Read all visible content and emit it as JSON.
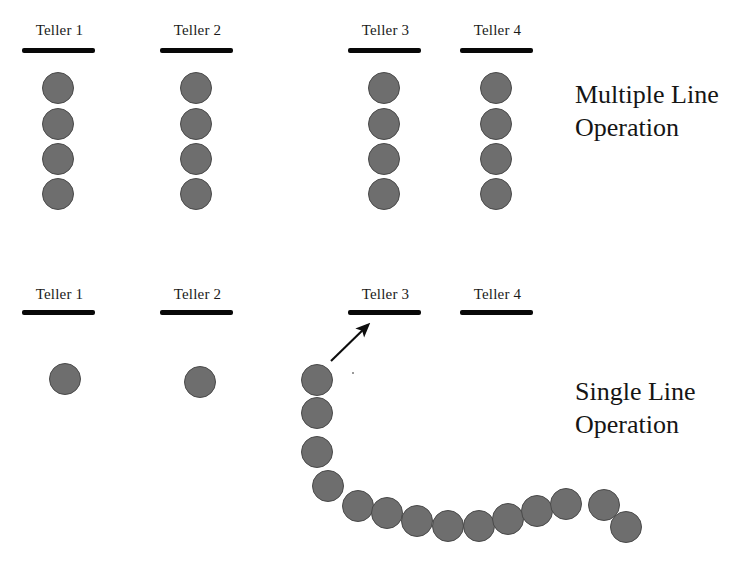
{
  "canvas": {
    "width": 742,
    "height": 565,
    "background": "#ffffff"
  },
  "style": {
    "person_fill": "#6e6e6e",
    "person_stroke": "#4a4a4a",
    "bar_color": "#080808",
    "text_color": "#151515",
    "person_diameter": 32
  },
  "sections": [
    {
      "id": "multiple-line",
      "caption_lines": [
        "Multiple Line",
        "Operation"
      ],
      "caption_x": 575,
      "caption_y": 78,
      "tellers": [
        {
          "label": "Teller 1",
          "label_x": 23,
          "label_y": 22,
          "bar": {
            "x": 22,
            "y": 48,
            "width": 73,
            "height": 5
          },
          "queue": [
            {
              "cx": 58,
              "cy": 88
            },
            {
              "cx": 58,
              "cy": 124
            },
            {
              "cx": 58,
              "cy": 159
            },
            {
              "cx": 58,
              "cy": 194
            }
          ]
        },
        {
          "label": "Teller 2",
          "label_x": 161,
          "label_y": 22,
          "bar": {
            "x": 160,
            "y": 48,
            "width": 73,
            "height": 5
          },
          "queue": [
            {
              "cx": 196,
              "cy": 88
            },
            {
              "cx": 196,
              "cy": 124
            },
            {
              "cx": 196,
              "cy": 159
            },
            {
              "cx": 196,
              "cy": 194
            }
          ]
        },
        {
          "label": "Teller 3",
          "label_x": 349,
          "label_y": 22,
          "bar": {
            "x": 348,
            "y": 48,
            "width": 73,
            "height": 5
          },
          "queue": [
            {
              "cx": 384,
              "cy": 88
            },
            {
              "cx": 384,
              "cy": 124
            },
            {
              "cx": 384,
              "cy": 159
            },
            {
              "cx": 384,
              "cy": 194
            }
          ]
        },
        {
          "label": "Teller 4",
          "label_x": 461,
          "label_y": 22,
          "bar": {
            "x": 460,
            "y": 48,
            "width": 73,
            "height": 5
          },
          "queue": [
            {
              "cx": 496,
              "cy": 88
            },
            {
              "cx": 496,
              "cy": 124
            },
            {
              "cx": 496,
              "cy": 159
            },
            {
              "cx": 496,
              "cy": 194
            }
          ]
        }
      ]
    },
    {
      "id": "single-line",
      "caption_lines": [
        "Single Line",
        "Operation"
      ],
      "caption_x": 575,
      "caption_y": 375,
      "tellers": [
        {
          "label": "Teller 1",
          "label_x": 23,
          "label_y": 286,
          "bar": {
            "x": 22,
            "y": 310,
            "width": 73,
            "height": 5
          },
          "queue": [
            {
              "cx": 65,
              "cy": 379
            }
          ]
        },
        {
          "label": "Teller 2",
          "label_x": 161,
          "label_y": 286,
          "bar": {
            "x": 160,
            "y": 310,
            "width": 73,
            "height": 5
          },
          "queue": [
            {
              "cx": 200,
              "cy": 382
            }
          ]
        },
        {
          "label": "Teller 3",
          "label_x": 349,
          "label_y": 286,
          "bar": {
            "x": 348,
            "y": 310,
            "width": 73,
            "height": 5
          },
          "queue": []
        },
        {
          "label": "Teller 4",
          "label_x": 461,
          "label_y": 286,
          "bar": {
            "x": 460,
            "y": 310,
            "width": 73,
            "height": 5
          },
          "queue": []
        }
      ],
      "single_queue": [
        {
          "cx": 317,
          "cy": 380
        },
        {
          "cx": 317,
          "cy": 413
        },
        {
          "cx": 317,
          "cy": 452
        },
        {
          "cx": 328,
          "cy": 486
        },
        {
          "cx": 358,
          "cy": 506
        },
        {
          "cx": 387,
          "cy": 513
        },
        {
          "cx": 417,
          "cy": 521
        },
        {
          "cx": 448,
          "cy": 526
        },
        {
          "cx": 479,
          "cy": 526
        },
        {
          "cx": 508,
          "cy": 519
        },
        {
          "cx": 537,
          "cy": 511
        },
        {
          "cx": 566,
          "cy": 504
        },
        {
          "cx": 604,
          "cy": 505
        },
        {
          "cx": 626,
          "cy": 527
        }
      ],
      "arrow": {
        "name": "queue-to-teller-arrow",
        "x1": 331,
        "y1": 361,
        "x2": 370,
        "y2": 323
      }
    }
  ]
}
